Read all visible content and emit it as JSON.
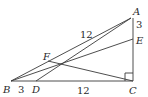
{
  "figure": {
    "points": {
      "A": {
        "label": "A",
        "x": 131,
        "y": 18
      },
      "B": {
        "label": "B",
        "x": 11,
        "y": 81
      },
      "C": {
        "label": "C",
        "x": 133,
        "y": 81
      },
      "D": {
        "label": "D",
        "x": 36,
        "y": 81
      },
      "E": {
        "label": "E",
        "x": 133,
        "y": 39
      },
      "F": {
        "label": "F",
        "x": 48,
        "y": 61
      }
    },
    "segments": [
      "AB",
      "AD",
      "BE",
      "FC",
      "AC",
      "BC"
    ],
    "right_angle_at": "C",
    "measurements": {
      "AB": "12",
      "BD": "3",
      "DC": "12",
      "AE": "3"
    }
  }
}
